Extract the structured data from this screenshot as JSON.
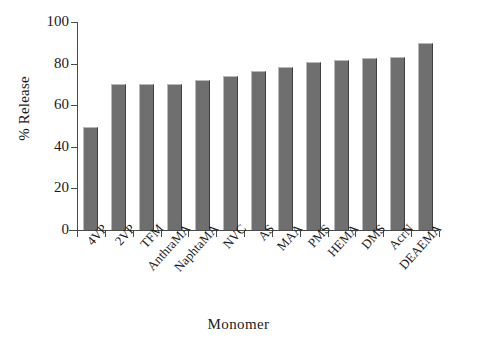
{
  "chart_data": {
    "type": "bar",
    "title": "",
    "xlabel": "Monomer",
    "ylabel": "% Release",
    "categories": [
      "4VP",
      "2VP",
      "TFM",
      "AnthraMA",
      "NaphtaMA",
      "NVC",
      "AS",
      "MAA",
      "PMS",
      "HEMA",
      "DMS",
      "AcrN",
      "DEAEMA"
    ],
    "values": [
      49.5,
      70,
      70,
      70,
      72,
      74,
      76.5,
      78.5,
      81,
      81.5,
      82.5,
      83,
      90
    ],
    "ylim": [
      0,
      100
    ],
    "yticks": [
      0,
      20,
      40,
      60,
      80,
      100
    ],
    "ytick_labels": [
      "0",
      "20",
      "40",
      "60",
      "80",
      "100"
    ],
    "grid": false,
    "legend": "none",
    "bar_color": "#6f6f6f",
    "axis_color": "#4a4a4a"
  }
}
